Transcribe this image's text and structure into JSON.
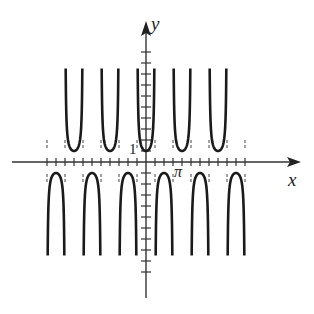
{
  "chart_data": {
    "type": "line",
    "function": "y = sec(2x)",
    "title": "",
    "xlabel": "x",
    "ylabel": "y",
    "annotations": [
      {
        "text": "1",
        "position": "y-axis tick at y=1"
      },
      {
        "text": "π",
        "position": "x-axis tick at x=π"
      }
    ],
    "xlim": [
      -3.35,
      3.35
    ],
    "ylim": [
      -13.8,
      12.4
    ],
    "period": "π",
    "asymptotes": [
      "x = π/4 + kπ/2"
    ],
    "branch_extent": 9.2,
    "y_ticks": [
      -10,
      -9,
      -8,
      -7,
      -6,
      -5,
      -4,
      -3,
      -2,
      -1,
      1,
      2,
      3,
      4,
      5,
      6,
      7,
      8,
      9,
      10
    ],
    "x_ticks_multiples_of_pi_over_4": true,
    "upper_branch_minima": [
      {
        "x": "-3π",
        "y": 1
      },
      {
        "x": "-2π",
        "y": 1
      },
      {
        "x": "-π",
        "y": 1
      },
      {
        "x": "0",
        "y": 1
      },
      {
        "x": "π",
        "y": 1
      },
      {
        "x": "2π",
        "y": 1
      },
      {
        "x": "3π",
        "y": 1
      }
    ],
    "lower_branch_maxima": [
      {
        "x": "-5π/2",
        "y": -1
      },
      {
        "x": "-3π/2",
        "y": -1
      },
      {
        "x": "-π/2",
        "y": -1
      },
      {
        "x": "π/2",
        "y": -1
      },
      {
        "x": "3π/2",
        "y": -1
      },
      {
        "x": "5π/2",
        "y": -1
      }
    ],
    "domain_shown": [
      "-2.75π",
      "2.75π"
    ],
    "grid": false,
    "legend": null,
    "colors": {
      "curve": "#1a1a1a",
      "axis": "#333333",
      "asymptote": "#444444"
    }
  },
  "labels": {
    "y_axis": "y",
    "x_axis": "x",
    "one": "1",
    "pi": "π"
  }
}
